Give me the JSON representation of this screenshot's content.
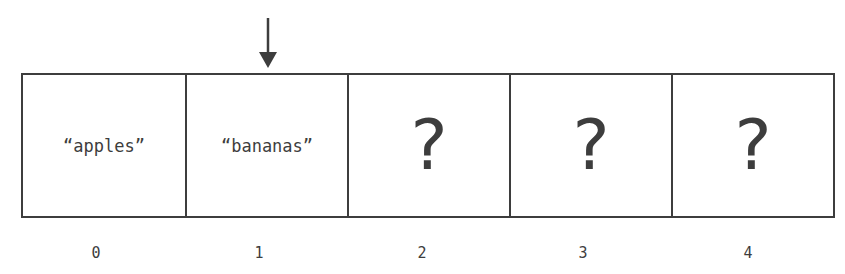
{
  "diagram": {
    "type": "array",
    "pointer_index": 1,
    "cells": [
      {
        "index": "0",
        "value": "“apples”",
        "kind": "string"
      },
      {
        "index": "1",
        "value": "“bananas”",
        "kind": "string"
      },
      {
        "index": "2",
        "value": "?",
        "kind": "unknown"
      },
      {
        "index": "3",
        "value": "?",
        "kind": "unknown"
      },
      {
        "index": "4",
        "value": "?",
        "kind": "unknown"
      }
    ],
    "colors": {
      "stroke": "#3d3d3d",
      "background": "#ffffff"
    }
  }
}
